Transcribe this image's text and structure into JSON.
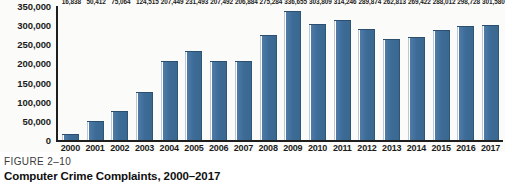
{
  "caption": {
    "figure_number": "FIGURE 2–10",
    "figure_title": "Computer Crime Complaints, 2000–2017"
  },
  "colors": {
    "bar_fill": "#3c6b97",
    "bar_edge": "#2c4f6f",
    "axis": "#1f1f1f",
    "plot_background": "#fbfbf9",
    "text": "#1b1b1b"
  },
  "chart_data": {
    "type": "bar",
    "title": "Computer Crime Complaints, 2000–2017",
    "xlabel": "",
    "ylabel": "",
    "ylim": [
      0,
      350000
    ],
    "grid": false,
    "legend": false,
    "y_ticks": [
      0,
      50000,
      100000,
      150000,
      200000,
      250000,
      300000,
      350000
    ],
    "y_tick_labels": [
      "0",
      "50,000",
      "100,000",
      "150,000",
      "200,000",
      "250,000",
      "300,000",
      "350,000"
    ],
    "categories": [
      "2000",
      "2001",
      "2002",
      "2003",
      "2004",
      "2005",
      "2006",
      "2007",
      "2008",
      "2009",
      "2010",
      "2011",
      "2012",
      "2013",
      "2014",
      "2015",
      "2016",
      "2017"
    ],
    "values": [
      16838,
      50412,
      75064,
      124515,
      207449,
      231493,
      207492,
      206884,
      275284,
      336655,
      303809,
      314246,
      289874,
      262813,
      269422,
      288012,
      298728,
      301580
    ],
    "data_labels": [
      "16,838",
      "50,412",
      "75,064",
      "124,515",
      "207,449",
      "231,493",
      "207,492",
      "206,884",
      "275,284",
      "336,655",
      "303,809",
      "314,246",
      "289,874",
      "262,813",
      "269,422",
      "288,012",
      "298,728",
      "301,580"
    ]
  }
}
